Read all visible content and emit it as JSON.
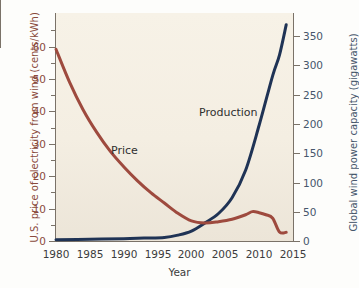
{
  "chart_data": {
    "type": "line",
    "title": "",
    "xlabel": "Year",
    "xlim": [
      1980,
      2015
    ],
    "xticks": [
      1980,
      1985,
      1990,
      1995,
      2000,
      2005,
      2010,
      2015
    ],
    "grid": false,
    "legend_position": "inline-annotations",
    "axes": [
      {
        "id": "left",
        "label": "U.S. price of electricity from wind (cents/kWh)",
        "color": "#8a4a3c",
        "lim": [
          0,
          66
        ],
        "ticks": [
          0,
          10,
          20,
          30,
          40,
          50,
          60
        ],
        "minor_ticks": [
          5,
          15,
          25,
          35,
          45,
          55,
          65
        ]
      },
      {
        "id": "right",
        "label": "Global wind power capacity (gigawatts)",
        "color": "#46566b",
        "lim": [
          0,
          390
        ],
        "ticks": [
          0,
          50,
          100,
          150,
          200,
          250,
          300,
          350
        ]
      }
    ],
    "series": [
      {
        "name": "Price",
        "annotation": "Price",
        "axis": "left",
        "color": "#9e4a3e",
        "unit": "cents/kWh",
        "x": [
          1980,
          1982,
          1984,
          1986,
          1988,
          1990,
          1992,
          1994,
          1996,
          1998,
          2000,
          2002,
          2004,
          2006,
          2008,
          2009,
          2010,
          2011,
          2012,
          2013,
          2014
        ],
        "values": [
          55.5,
          46.0,
          38.0,
          31.5,
          26.0,
          21.5,
          17.5,
          14.0,
          11.0,
          8.0,
          5.8,
          5.2,
          5.6,
          6.3,
          7.6,
          8.5,
          8.2,
          7.6,
          6.6,
          2.6,
          2.5
        ]
      },
      {
        "name": "Production",
        "annotation": "Production",
        "axis": "right",
        "color": "#1f3355",
        "unit": "gigawatts",
        "x": [
          1980,
          1985,
          1990,
          1993,
          1996,
          1998,
          2000,
          2002,
          2004,
          2006,
          2008,
          2010,
          2012,
          2013,
          2014
        ],
        "values": [
          2,
          3,
          4,
          5,
          6,
          10,
          17,
          31,
          47,
          74,
          121,
          198,
          283,
          318,
          370
        ]
      }
    ]
  }
}
